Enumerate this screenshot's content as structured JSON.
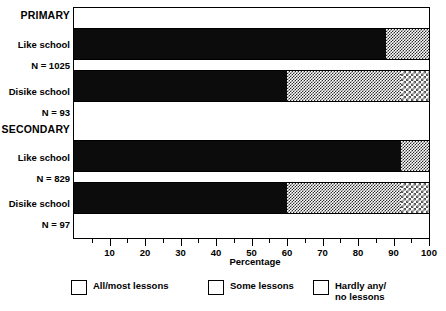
{
  "chart_data": {
    "type": "bar",
    "orientation": "horizontal",
    "stacked": true,
    "title": "",
    "xlabel": "Percentage",
    "ylabel": "",
    "xlim": [
      0,
      100
    ],
    "xticks": [
      10,
      20,
      30,
      40,
      50,
      60,
      70,
      80,
      90,
      100
    ],
    "xtick_labels": [
      "10",
      "20",
      "30",
      "40",
      "50",
      "60",
      "70",
      "80",
      "90",
      "100"
    ],
    "minor_tick_step": 5,
    "grid": false,
    "legend_position": "bottom",
    "groups": [
      {
        "heading": "PRIMARY",
        "rows": [
          {
            "label": "Like school",
            "n_label": "N = 1025",
            "values": [
              88,
              12,
              0
            ]
          },
          {
            "label": "Disike school",
            "n_label": "N = 93",
            "values": [
              60,
              32,
              8
            ]
          }
        ]
      },
      {
        "heading": "SECONDARY",
        "rows": [
          {
            "label": "Like school",
            "n_label": "N = 829",
            "values": [
              92,
              8,
              0
            ]
          },
          {
            "label": "Disike school",
            "n_label": "N = 97",
            "values": [
              60,
              32,
              8
            ]
          }
        ]
      }
    ],
    "series": [
      {
        "name": "All/most lessons",
        "values": [
          88,
          60,
          92,
          60
        ],
        "pattern": "solid",
        "color": "#0c0c0c"
      },
      {
        "name": "Some lessons",
        "values": [
          12,
          32,
          8,
          32
        ],
        "pattern": "medium",
        "color": "#2b2b2b"
      },
      {
        "name": "Hardly any/\nno lessons",
        "values": [
          0,
          8,
          0,
          8
        ],
        "pattern": "light",
        "color": "#555555"
      }
    ],
    "categories": [
      "PRIMARY / Like school",
      "PRIMARY / Disike school",
      "SECONDARY / Like school",
      "SECONDARY / Disike school"
    ]
  },
  "labels": {
    "group_primary": "PRIMARY",
    "group_secondary": "SECONDARY",
    "row1_name": "Like school",
    "row1_n": "N = 1025",
    "row2_name": "Disike school",
    "row2_n": "N = 93",
    "row3_name": "Like school",
    "row3_n": "N = 829",
    "row4_name": "Disike school",
    "row4_n": "N = 97"
  },
  "axis": {
    "title": "Percentage",
    "t10": "10",
    "t20": "20",
    "t30": "30",
    "t40": "40",
    "t50": "50",
    "t60": "60",
    "t70": "70",
    "t80": "80",
    "t90": "90",
    "t100": "100"
  },
  "legend": {
    "item1": "All/most lessons",
    "item2": "Some lessons",
    "item3": "Hardly any/\nno lessons"
  }
}
